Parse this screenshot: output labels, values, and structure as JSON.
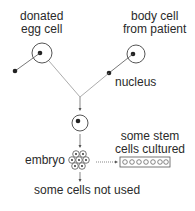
{
  "labels": {
    "donated_egg": [
      "donated",
      "egg cell"
    ],
    "body_cell": [
      "body cell",
      "from patient"
    ],
    "nucleus": "nucleus",
    "embryo": "embryo",
    "stem_cells": [
      "some stem",
      "cells cultured"
    ],
    "not_used": "some cells not used"
  },
  "colors": {
    "line": "#555555",
    "text": "#2a2a2a"
  }
}
